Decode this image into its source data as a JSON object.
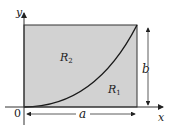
{
  "figure": {
    "colors": {
      "region_fill": "#d2d2d2",
      "line": "#222222",
      "curve": "#1a1a1a",
      "background": "#ffffff"
    },
    "axes": {
      "x_label": "x",
      "y_label": "y",
      "origin_label": "0"
    },
    "regions": {
      "upper_label": "R",
      "upper_subscript": "2",
      "lower_label": "R",
      "lower_subscript": "1"
    },
    "dimensions": {
      "width_label": "a",
      "height_label": "b"
    }
  }
}
